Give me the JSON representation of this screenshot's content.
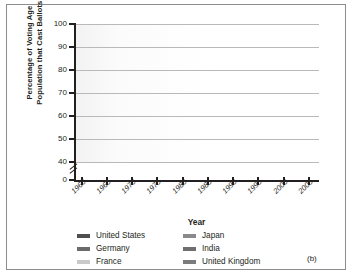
{
  "figure": {
    "panel_label": "(b)"
  },
  "chart_data": {
    "type": "line",
    "title": "",
    "xlabel": "Year",
    "ylabel": "Percentage of Voting Age Population that Cast Ballots",
    "ylabel_lines": [
      "Percentage of Voting Age",
      "Population that Cast Ballots"
    ],
    "x": [
      1960,
      1965,
      1970,
      1975,
      1980,
      1985,
      1990,
      1995,
      2000,
      2005
    ],
    "xticklabels": [
      "1960",
      "1965",
      "1970",
      "1975",
      "1980",
      "1985",
      "1990",
      "1995",
      "2000",
      "2005"
    ],
    "yticklabels": [
      "0",
      "40",
      "50",
      "60",
      "70",
      "80",
      "90",
      "100"
    ],
    "ylim": [
      40,
      100
    ],
    "y_axis_break": true,
    "y_break_note": "axis broken between 0 and 40",
    "grid": "horizontal",
    "legend_position": "below",
    "series": [
      {
        "name": "United States",
        "color": "#4f4f4f",
        "x": [
          1962,
          1964,
          1966,
          1968,
          1972,
          1976,
          1980,
          1984,
          1988,
          1992,
          1996,
          2000,
          2004
        ],
        "values": [
          55.0,
          63.4,
          58.0,
          57.0,
          55.0,
          53.5,
          53.8,
          54.2,
          51.5,
          59.0,
          49.0,
          51.2,
          56.5
        ]
      },
      {
        "name": "Germany",
        "color": "#6b6b6b",
        "x": [
          1961,
          1965,
          1969,
          1972,
          1976,
          1980,
          1983,
          1987,
          1990,
          1994,
          1998,
          2002,
          2005
        ],
        "values": [
          87.8,
          80.2,
          80.3,
          89.5,
          85.0,
          83.2,
          82.5,
          80.0,
          76.8,
          75.4,
          74.2,
          68.5,
          59.0
        ]
      },
      {
        "name": "France",
        "color": "#c9c9c9",
        "x": [
          1962,
          1967,
          1968,
          1973,
          1978,
          1981,
          1986,
          1988,
          1993,
          1997,
          2002
        ],
        "values": [
          71.3,
          70.5,
          69.4,
          71.6,
          74.0,
          70.0,
          72.8,
          72.5,
          76.8,
          78.0,
          80.0
        ]
      },
      {
        "name": "Japan",
        "color": "#8a8a8a",
        "x": [
          1960,
          1963,
          1967,
          1969,
          1972,
          1976,
          1979,
          1980,
          1983,
          1986,
          1990,
          1993,
          1996,
          2000,
          2003
        ],
        "values": [
          71.5,
          69.3,
          74.0,
          69.0,
          71.8,
          73.5,
          68.5,
          74.6,
          68.8,
          71.5,
          73.3,
          67.3,
          59.6,
          62.5,
          59.8
        ]
      },
      {
        "name": "India",
        "color": "#6f6f6f",
        "x": [
          1962,
          1967,
          1971,
          1977,
          1980,
          1984,
          1989,
          1991,
          1996,
          1998,
          1999,
          2004
        ],
        "values": [
          63.5,
          62.0,
          60.5,
          65.5,
          62.5,
          65.8,
          64.0,
          59.0,
          47.0,
          61.5,
          61.0,
          62.8
        ]
      },
      {
        "name": "United Kingdom",
        "color": "#7c7c7c",
        "x": [
          1964,
          1966,
          1970,
          1974,
          1979,
          1983,
          1987,
          1992,
          1997,
          2001,
          2005
        ],
        "values": [
          75.5,
          72.8,
          70.0,
          75.4,
          76.5,
          73.0,
          75.8,
          76.0,
          71.0,
          59.5,
          61.0
        ]
      }
    ]
  },
  "legend": {
    "left_column": [
      {
        "label": "United States",
        "color": "#4f4f4f"
      },
      {
        "label": "Germany",
        "color": "#6b6b6b"
      },
      {
        "label": "France",
        "color": "#c9c9c9"
      }
    ],
    "right_column": [
      {
        "label": "Japan",
        "color": "#8a8a8a"
      },
      {
        "label": "India",
        "color": "#6f6f6f"
      },
      {
        "label": "United Kingdom",
        "color": "#7c7c7c"
      }
    ]
  }
}
